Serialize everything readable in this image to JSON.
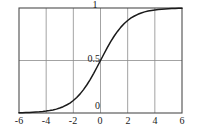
{
  "chart_data": {
    "type": "line",
    "title": "",
    "subtitle": "",
    "xlabel": "",
    "ylabel": "",
    "xlim": [
      -6,
      6
    ],
    "ylim": [
      0,
      1
    ],
    "grid": true,
    "legend": null,
    "x_ticks": [
      -6,
      -4,
      -2,
      0,
      2,
      4,
      6
    ],
    "x_tick_labels": [
      "-6",
      "-4",
      "-2",
      "0",
      "2",
      "4",
      "6"
    ],
    "y_ticks": [
      0,
      0.5,
      1
    ],
    "y_tick_labels": [
      "0",
      "0.5",
      "1"
    ],
    "series": [
      {
        "name": "logistic sigmoid",
        "color": "#1a1a1a",
        "x": [
          -6,
          -5.75,
          -5.5,
          -5.25,
          -5,
          -4.75,
          -4.5,
          -4.25,
          -4,
          -3.75,
          -3.5,
          -3.25,
          -3,
          -2.75,
          -2.5,
          -2.25,
          -2,
          -1.75,
          -1.5,
          -1.25,
          -1,
          -0.75,
          -0.5,
          -0.25,
          0,
          0.25,
          0.5,
          0.75,
          1,
          1.25,
          1.5,
          1.75,
          2,
          2.25,
          2.5,
          2.75,
          3,
          3.25,
          3.5,
          3.75,
          4,
          4.25,
          4.5,
          4.75,
          5,
          5.25,
          5.5,
          5.75,
          6
        ],
        "y": [
          0.002,
          0.003,
          0.004,
          0.005,
          0.007,
          0.009,
          0.011,
          0.014,
          0.018,
          0.023,
          0.029,
          0.037,
          0.047,
          0.06,
          0.076,
          0.095,
          0.119,
          0.148,
          0.182,
          0.223,
          0.269,
          0.321,
          0.378,
          0.438,
          0.5,
          0.562,
          0.622,
          0.679,
          0.731,
          0.777,
          0.818,
          0.852,
          0.881,
          0.905,
          0.924,
          0.94,
          0.953,
          0.963,
          0.971,
          0.977,
          0.982,
          0.986,
          0.989,
          0.991,
          0.993,
          0.995,
          0.996,
          0.997,
          0.998
        ]
      }
    ],
    "grid_color": "#8c8c8c",
    "frame_color": "#4d4d4d",
    "background": "#ffffff"
  },
  "labels": {
    "y_top": "1",
    "y_mid": "0.5",
    "y_bottom": "0",
    "x_neg6": "-6",
    "x_neg4": "-4",
    "x_neg2": "-2",
    "x_zero": "0",
    "x_pos2": "2",
    "x_pos4": "4",
    "x_pos6": "6"
  }
}
